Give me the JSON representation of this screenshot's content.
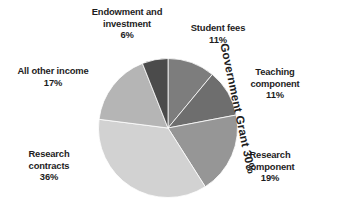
{
  "chart_data": {
    "type": "pie",
    "title": "",
    "subtitle": "",
    "xlabel": "",
    "ylabel": "",
    "grid": false,
    "legend_position": "none",
    "units": "percent",
    "labels_show_percent": true,
    "categories": [
      "Student fees",
      "Teaching component",
      "Research component",
      "Research contracts",
      "All other income",
      "Endowment and investment"
    ],
    "values": [
      11,
      11,
      19,
      36,
      17,
      6
    ],
    "colors": [
      "#7d7d7d",
      "#6e6e6e",
      "#969696",
      "#d2d2d2",
      "#b5b5b5",
      "#4b4b4b"
    ],
    "slices": [
      {
        "name": "Student fees",
        "label_line1": "Student fees",
        "label_line2": "11%",
        "value": 11,
        "percent": "11%",
        "color": "#7d7d7d",
        "start_deg": 0,
        "end_deg": 39.6
      },
      {
        "name": "Teaching component",
        "label_line1": "Teaching",
        "label_line2": "component",
        "label_line3": "11%",
        "value": 11,
        "percent": "11%",
        "color": "#6e6e6e",
        "start_deg": 39.6,
        "end_deg": 79.2
      },
      {
        "name": "Research component",
        "label_line1": "Research",
        "label_line2": "component",
        "label_line3": "19%",
        "value": 19,
        "percent": "19%",
        "color": "#969696",
        "start_deg": 79.2,
        "end_deg": 147.6
      },
      {
        "name": "Research contracts",
        "label_line1": "Research",
        "label_line2": "contracts",
        "label_line3": "36%",
        "value": 36,
        "percent": "36%",
        "color": "#d2d2d2",
        "start_deg": 147.6,
        "end_deg": 277.2
      },
      {
        "name": "All other income",
        "label_line1": "All other income",
        "label_line2": "17%",
        "value": 17,
        "percent": "17%",
        "color": "#b5b5b5",
        "start_deg": 277.2,
        "end_deg": 338.4
      },
      {
        "name": "Endowment and investment",
        "label_line1": "Endowment and",
        "label_line2": "investment",
        "label_line3": "6%",
        "value": 6,
        "percent": "6%",
        "color": "#4b4b4b",
        "start_deg": 338.4,
        "end_deg": 360
      }
    ],
    "annotations": [
      {
        "name": "government-grant-bracket",
        "text": "Government Grant 30%",
        "value": 30,
        "percent": "30%",
        "groups": [
          "Teaching component",
          "Research component"
        ],
        "rotation_deg": 78
      }
    ]
  },
  "labels": {
    "endowment": {
      "line1": "Endowment and",
      "line2": "investment",
      "line3": "6%"
    },
    "student_fees": {
      "line1": "Student fees",
      "line2": "11%"
    },
    "teaching": {
      "line1": "Teaching",
      "line2": "component",
      "line3": "11%"
    },
    "research_component": {
      "line1": "Research",
      "line2": "component",
      "line3": "19%"
    },
    "research_contracts": {
      "line1": "Research",
      "line2": "contracts",
      "line3": "36%"
    },
    "other_income": {
      "line1": "All other income",
      "line2": "17%"
    },
    "government_grant": {
      "text": "Government Grant 30%"
    }
  }
}
